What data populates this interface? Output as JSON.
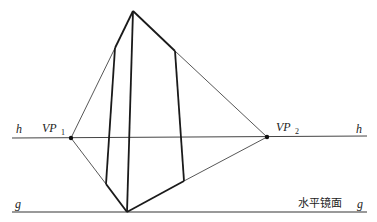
{
  "diagram": {
    "labels": {
      "horizon_left": "h",
      "horizon_right": "h",
      "ground_left": "g",
      "ground_right": "g",
      "vp1_main": "VP",
      "vp1_sub": "1",
      "vp2_main": "VP",
      "vp2_sub": "2",
      "mirror_plane": "水平镜面"
    },
    "points": {
      "apex": [
        133,
        11
      ],
      "bottom": [
        127,
        212
      ],
      "vp1": [
        71,
        138
      ],
      "vp2": [
        267,
        137
      ],
      "left_top": [
        115,
        48
      ],
      "left_bottom": [
        106,
        184
      ],
      "right_top": [
        175,
        51
      ],
      "right_bottom": [
        184,
        181
      ]
    },
    "lines": {
      "horizon_y": 137,
      "ground_y": 212,
      "x_start": 12,
      "x_end": 367
    },
    "colors": {
      "stroke_bold": "#1a1a1a",
      "stroke_thin": "#444444",
      "ground_line": "#777777"
    }
  }
}
